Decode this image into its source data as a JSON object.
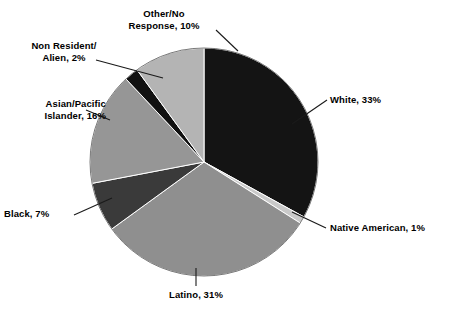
{
  "chart_data": {
    "type": "pie",
    "title": "",
    "xlabel": "",
    "ylabel": "",
    "legend_position": "none",
    "grid": false,
    "units": "percent",
    "start_angle_deg": 0,
    "direction": "clockwise",
    "categories": [
      "White",
      "Native American",
      "Latino",
      "Black",
      "Asian/Pacific Islander",
      "Non Resident/Alien",
      "Other/No Response"
    ],
    "values": [
      33,
      1,
      31,
      7,
      16,
      2,
      10
    ],
    "colors": [
      "#141414",
      "#c9c9c9",
      "#8f8f8f",
      "#3a3a3a",
      "#969696",
      "#111111",
      "#b4b4b4"
    ],
    "slices": [
      {
        "key": "white",
        "label": "White, 33%",
        "value": 33,
        "color": "#141414"
      },
      {
        "key": "native",
        "label": "Native American, 1%",
        "value": 1,
        "color": "#c9c9c9"
      },
      {
        "key": "latino",
        "label": "Latino, 31%",
        "value": 31,
        "color": "#8f8f8f"
      },
      {
        "key": "black",
        "label": "Black, 7%",
        "value": 7,
        "color": "#3a3a3a"
      },
      {
        "key": "asian",
        "label": "Asian/Pacific\nIslander, 16%",
        "value": 16,
        "color": "#969696"
      },
      {
        "key": "nonres",
        "label": "Non Resident/\nAlien, 2%",
        "value": 2,
        "color": "#111111"
      },
      {
        "key": "other",
        "label": "Other/No\nResponse, 10%",
        "value": 10,
        "color": "#b4b4b4"
      }
    ]
  },
  "labels": {
    "white": "White, 33%",
    "native": "Native American, 1%",
    "latino": "Latino, 31%",
    "black": "Black, 7%",
    "asian": "Asian/Pacific\nIslander, 16%",
    "nonres": "Non Resident/\nAlien, 2%",
    "other": "Other/No\nResponse, 10%"
  },
  "style": {
    "background": "#ffffff",
    "text_color": "#000000",
    "leader_color": "#1a1a1a",
    "outline_color": "#5a5a5a"
  }
}
